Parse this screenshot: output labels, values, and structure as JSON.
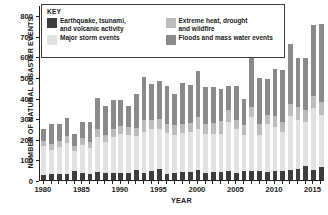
{
  "chart_data": {
    "type": "bar",
    "stacked": true,
    "title": "",
    "xlabel": "YEAR",
    "ylabel": "NUMBER OF NATURAL DISASTER EVENTS",
    "ylim": [
      0,
      850
    ],
    "yticks": [
      0,
      100,
      200,
      300,
      400,
      500,
      600,
      700,
      800
    ],
    "grid": false,
    "legend_position": "top-left-inside",
    "legend_title": "KEY",
    "x": [
      1980,
      1981,
      1982,
      1983,
      1984,
      1985,
      1986,
      1987,
      1988,
      1989,
      1990,
      1991,
      1992,
      1993,
      1994,
      1995,
      1996,
      1997,
      1998,
      1999,
      2000,
      2001,
      2002,
      2003,
      2004,
      2005,
      2006,
      2007,
      2008,
      2009,
      2010,
      2011,
      2012,
      2013,
      2014,
      2015,
      2016
    ],
    "xticks": [
      1980,
      1985,
      1990,
      1995,
      2000,
      2005,
      2010,
      2015
    ],
    "series": [
      {
        "name": "Earthquake, tsunami,\nand volcanic activity",
        "color": "#3d3d3d",
        "values": [
          25,
          28,
          30,
          30,
          46,
          32,
          30,
          38,
          36,
          36,
          35,
          36,
          48,
          33,
          45,
          55,
          28,
          36,
          38,
          40,
          48,
          35,
          40,
          40,
          42,
          34,
          42,
          43,
          45,
          40,
          45,
          44,
          50,
          52,
          70,
          48,
          62
        ]
      },
      {
        "name": "Major storm events",
        "color": "#e2e2e2",
        "values": [
          140,
          120,
          130,
          150,
          95,
          140,
          125,
          172,
          147,
          172,
          190,
          185,
          165,
          200,
          205,
          195,
          200,
          185,
          190,
          193,
          200,
          190,
          185,
          185,
          240,
          215,
          175,
          262,
          175,
          230,
          215,
          190,
          260,
          240,
          210,
          300,
          255
        ]
      },
      {
        "name": "Extreme heat, drought\nand wildfire",
        "color": "#bcbcbc",
        "values": [
          25,
          27,
          28,
          35,
          22,
          30,
          28,
          40,
          38,
          42,
          35,
          35,
          40,
          60,
          42,
          45,
          45,
          45,
          45,
          42,
          60,
          45,
          50,
          60,
          60,
          45,
          48,
          52,
          50,
          48,
          50,
          48,
          60,
          62,
          58,
          60,
          62
        ]
      },
      {
        "name": "Floods and mass water events",
        "color": "#8a8a8a",
        "values": [
          57,
          95,
          82,
          85,
          62,
          78,
          97,
          148,
          138,
          140,
          130,
          105,
          165,
          208,
          177,
          185,
          182,
          152,
          197,
          185,
          220,
          180,
          175,
          155,
          116,
          165,
          130,
          255,
          225,
          175,
          230,
          254,
          290,
          240,
          255,
          347,
          380
        ]
      }
    ],
    "bar_totals": [
      247,
      270,
      270,
      300,
      225,
      280,
      280,
      398,
      359,
      390,
      390,
      361,
      418,
      501,
      469,
      480,
      455,
      418,
      470,
      460,
      528,
      450,
      450,
      440,
      458,
      459,
      395,
      612,
      495,
      493,
      540,
      536,
      660,
      594,
      593,
      755,
      759
    ]
  },
  "legend": {
    "title": "KEY",
    "items": [
      {
        "label": "Earthquake, tsunami,\nand volcanic activity",
        "color": "#3d3d3d"
      },
      {
        "label": "Major storm events",
        "color": "#e2e2e2"
      },
      {
        "label": "Extreme heat, drought\nand wildfire",
        "color": "#bcbcbc"
      },
      {
        "label": "Floods and mass water events",
        "color": "#8a8a8a"
      }
    ]
  },
  "axes": {
    "y_title": "NUMBER OF NATURAL DISASTER EVENTS",
    "x_title": "YEAR"
  }
}
